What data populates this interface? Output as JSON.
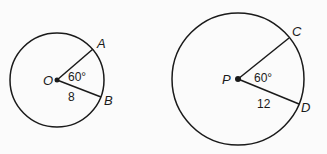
{
  "diagram": {
    "circles": [
      {
        "center_label": "O",
        "radius_label": "8",
        "angle_label": "60°",
        "point1_label": "A",
        "point2_label": "B"
      },
      {
        "center_label": "P",
        "radius_label": "12",
        "angle_label": "60°",
        "point1_label": "C",
        "point2_label": "D"
      }
    ],
    "colors": {
      "stroke": "#1a1a1a",
      "background": "#fbfbfb"
    }
  }
}
